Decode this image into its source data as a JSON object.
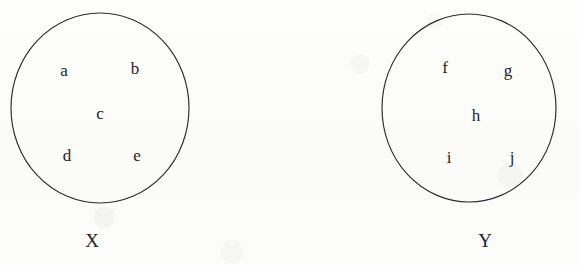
{
  "figure": {
    "type": "set-membership-diagram",
    "background_color": "#fdfdfb",
    "stroke_color": "#2b2b30",
    "text_color": "#23232a"
  },
  "sets": [
    {
      "id": "set-x",
      "label": "X",
      "label_position": {
        "x": 92,
        "y": 240
      },
      "circle": {
        "cx": 100,
        "cy": 108,
        "rx": 89,
        "ry": 95
      },
      "members": [
        {
          "text": "a",
          "x": 64,
          "y": 70
        },
        {
          "text": "b",
          "x": 135,
          "y": 68
        },
        {
          "text": "c",
          "x": 100,
          "y": 113
        },
        {
          "text": "d",
          "x": 67,
          "y": 155
        },
        {
          "text": "e",
          "x": 137,
          "y": 155
        }
      ]
    },
    {
      "id": "set-y",
      "label": "Y",
      "label_position": {
        "x": 485,
        "y": 240
      },
      "circle": {
        "cx": 469,
        "cy": 108,
        "rx": 87,
        "ry": 94
      },
      "members": [
        {
          "text": "f",
          "x": 445,
          "y": 67
        },
        {
          "text": "g",
          "x": 508,
          "y": 70
        },
        {
          "text": "h",
          "x": 476,
          "y": 115
        },
        {
          "text": "i",
          "x": 449,
          "y": 157
        },
        {
          "text": "j",
          "x": 512,
          "y": 157
        }
      ]
    }
  ]
}
